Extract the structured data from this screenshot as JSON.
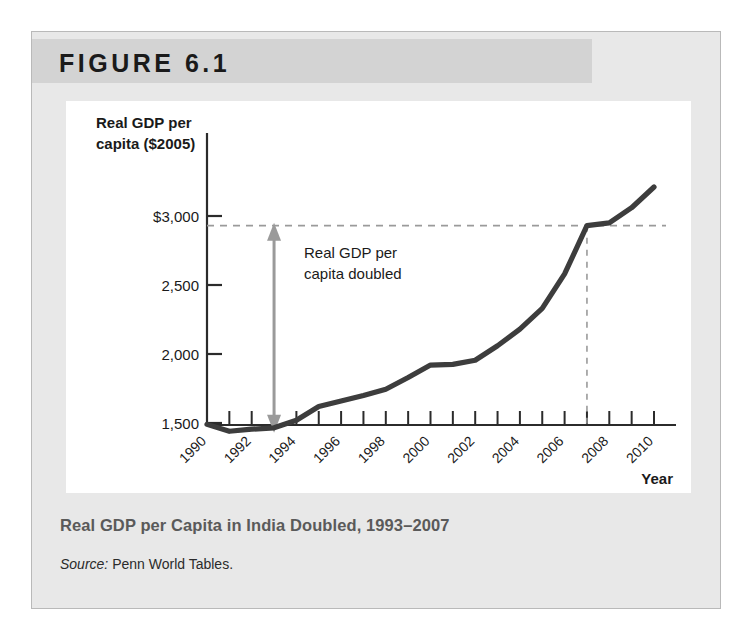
{
  "figure": {
    "number_label": "FIGURE 6.1",
    "caption": "Real GDP per Capita in India Doubled, 1993–2007",
    "source_label": "Source:",
    "source_text": " Penn World Tables."
  },
  "chart_data": {
    "type": "line",
    "title": "Real GDP per Capita in India Doubled, 1993–2007",
    "ylabel_line1": "Real GDP per",
    "ylabel_line2": "capita ($2005)",
    "xlabel": "Year",
    "xlim": [
      1990,
      2010
    ],
    "ylim": [
      1380,
      3260
    ],
    "grid": false,
    "legend": "none",
    "ytick_labels": [
      "$3,000",
      "2,500",
      "2,000",
      "1,500"
    ],
    "ytick_values": [
      3000,
      2500,
      2000,
      1500
    ],
    "xtick_labels": [
      "1990",
      "1992",
      "1994",
      "1996",
      "1998",
      "2000",
      "2002",
      "2004",
      "2006",
      "2008",
      "2010"
    ],
    "xtick_values": [
      1990,
      1992,
      1994,
      1996,
      1998,
      2000,
      2002,
      2004,
      2006,
      2008,
      2010
    ],
    "x": [
      1990,
      1991,
      1992,
      1993,
      1994,
      1995,
      1996,
      1997,
      1998,
      1999,
      2000,
      2001,
      2002,
      2003,
      2004,
      2005,
      2006,
      2007,
      2008,
      2009,
      2010
    ],
    "values": [
      1490,
      1440,
      1455,
      1465,
      1520,
      1620,
      1660,
      1700,
      1745,
      1830,
      1920,
      1925,
      1955,
      2060,
      2180,
      2330,
      2580,
      2930,
      2950,
      3060,
      3210
    ],
    "series": [
      {
        "name": "Real GDP per capita (India, $2005)",
        "values": [
          1490,
          1440,
          1455,
          1465,
          1520,
          1620,
          1660,
          1700,
          1745,
          1830,
          1920,
          1925,
          1955,
          2060,
          2180,
          2330,
          2580,
          2930,
          2950,
          3060,
          3210
        ],
        "color": "#3d3d3d"
      }
    ],
    "annotations": [
      {
        "name": "doubling-arrow",
        "kind": "double-headed-arrow",
        "at_year": 1993,
        "from_value": 1465,
        "to_value": 2930,
        "color": "#9a9a9a",
        "text_line1": "Real GDP per",
        "text_line2": "capita doubled"
      },
      {
        "name": "reference-line-horizontal",
        "kind": "dashed-horizontal",
        "at_value": 2930,
        "color": "#9a9a9a"
      },
      {
        "name": "reference-line-vertical",
        "kind": "dashed-vertical",
        "at_year": 2007,
        "color": "#9a9a9a"
      }
    ]
  }
}
